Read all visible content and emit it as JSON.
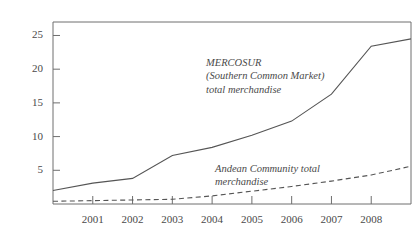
{
  "chart_data": {
    "type": "line",
    "title": "",
    "xlabel": "",
    "ylabel": "",
    "x": [
      2000,
      2001,
      2002,
      2003,
      2004,
      2005,
      2006,
      2007,
      2008,
      2009
    ],
    "xlim": [
      2000,
      2009
    ],
    "ylim": [
      0,
      27
    ],
    "grid": false,
    "legend_position": "inline-annotation",
    "xtick_labels": [
      "2001",
      "2002",
      "2003",
      "2004",
      "2005",
      "2006",
      "2007",
      "2008"
    ],
    "xtick_values": [
      2001,
      2002,
      2003,
      2004,
      2005,
      2006,
      2007,
      2008
    ],
    "ytick_labels": [
      "5",
      "10",
      "15",
      "20",
      "25"
    ],
    "ytick_values": [
      5,
      10,
      15,
      20,
      25
    ],
    "series": [
      {
        "name": "MERCOSUR (Southern Common Market) total merchandise",
        "style": "solid",
        "color": "#555555",
        "values": [
          2.0,
          3.1,
          3.8,
          7.2,
          8.4,
          10.2,
          12.3,
          16.3,
          23.4,
          24.5
        ]
      },
      {
        "name": "Andean Community total merchandise",
        "style": "dashed",
        "color": "#555555",
        "values": [
          0.4,
          0.5,
          0.6,
          0.7,
          1.2,
          1.9,
          2.6,
          3.4,
          4.3,
          5.6
        ]
      }
    ],
    "annotations": [
      {
        "id": "mercosur",
        "lines": [
          "MERCOSUR",
          "(Southern Common Market)",
          "total merchandise"
        ]
      },
      {
        "id": "andean",
        "lines": [
          "Andean Community total",
          "merchandise"
        ]
      }
    ]
  },
  "colors": {
    "axis": "#6e6e6e",
    "line": "#555555",
    "text": "#4a4a4a",
    "background": "#ffffff"
  }
}
